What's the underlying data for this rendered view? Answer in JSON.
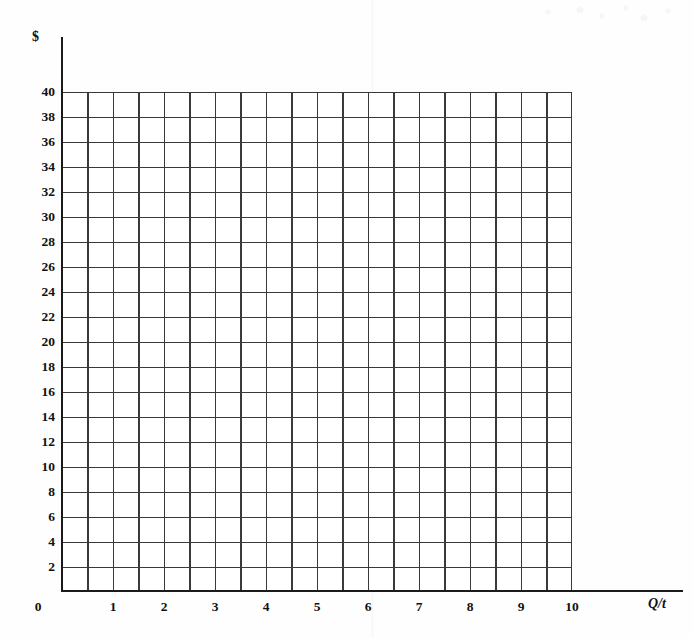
{
  "chart_data": {
    "type": "line",
    "title": "",
    "subtitle": "",
    "xlabel": "Q/t",
    "ylabel": "$",
    "xlim": [
      0,
      10
    ],
    "ylim": [
      0,
      40
    ],
    "grid": true,
    "legend": null,
    "series": [],
    "x_ticks": [
      "0",
      "1",
      "2",
      "3",
      "4",
      "5",
      "6",
      "7",
      "8",
      "9",
      "10"
    ],
    "x_tick_values": [
      0,
      1,
      2,
      3,
      4,
      5,
      6,
      7,
      8,
      9,
      10
    ],
    "y_ticks": [
      "40",
      "38",
      "36",
      "34",
      "32",
      "30",
      "28",
      "26",
      "24",
      "22",
      "20",
      "18",
      "16",
      "14",
      "12",
      "10",
      "8",
      "6",
      "4",
      "2"
    ],
    "y_tick_values": [
      40,
      38,
      36,
      34,
      32,
      30,
      28,
      26,
      24,
      22,
      20,
      18,
      16,
      14,
      12,
      10,
      8,
      6,
      4,
      2
    ],
    "x_minor_step": 0.5,
    "y_minor_step": 2,
    "grid_columns": 20,
    "grid_rows": 20,
    "annotations": [],
    "note": "Blank economics graph paper: price ($) versus quantity per time period (Q/t)."
  },
  "axes": {
    "y_title": "$",
    "x_title": "Q/t",
    "origin_label": "0"
  },
  "colors": {
    "background": "#fefefe",
    "grid_line": "#3a3a3a",
    "axis_line": "#1a1a1a",
    "label_text": "#111111"
  }
}
